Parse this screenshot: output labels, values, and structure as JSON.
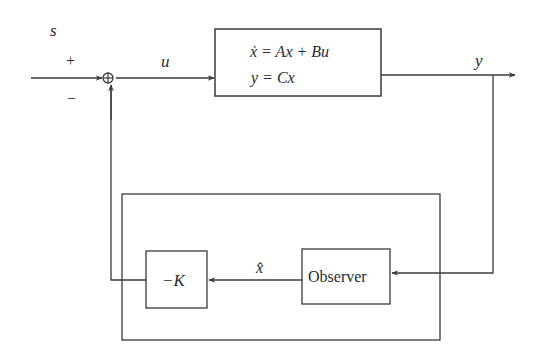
{
  "diagram": {
    "type": "block-diagram",
    "signals": {
      "reference": "s",
      "plus_sign": "+",
      "minus_sign": "−",
      "control": "u",
      "output": "y",
      "estimate": "x̂"
    },
    "blocks": {
      "plant": {
        "line1": "ẋ = Ax + Bu",
        "line2": "y = Cx"
      },
      "gain": {
        "label": "−K"
      },
      "observer": {
        "label": "Observer"
      }
    },
    "summing_junction": "⊕",
    "colors": {
      "line": "#3a3a3a",
      "text": "#2a2a2a",
      "background": "#ffffff"
    }
  }
}
